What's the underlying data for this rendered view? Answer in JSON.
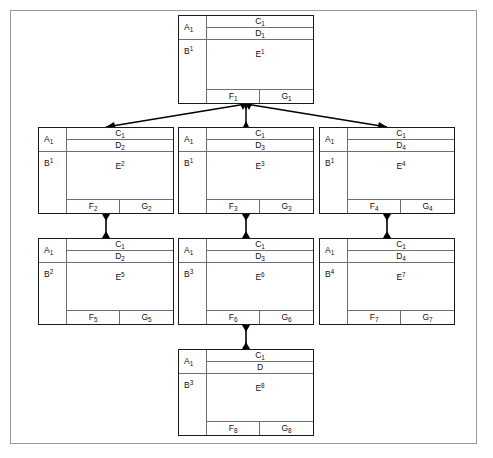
{
  "diagram": {
    "frame": {
      "stroke": "#9a9a9a"
    },
    "node_border_color": "#1a1a1a",
    "divider_color": "#6e6e6e",
    "connector_color": "#000000",
    "nodes": [
      {
        "id": "n1",
        "role": "root",
        "a": "A",
        "a_sub": "1",
        "b": "B",
        "b_sub": "1",
        "c": "C",
        "c_sub": "1",
        "d": "D",
        "d_sub": "1",
        "e": "E",
        "e_sub": "1",
        "f": "F",
        "f_sub": "1",
        "g": "G",
        "g_sub": "1"
      },
      {
        "id": "n2",
        "role": "row2-left",
        "a": "A",
        "a_sub": "1",
        "b": "B",
        "b_sub": "1",
        "c": "C",
        "c_sub": "1",
        "d": "D",
        "d_sub": "2",
        "e": "E",
        "e_sub": "2",
        "f": "F",
        "f_sub": "2",
        "g": "G",
        "g_sub": "2"
      },
      {
        "id": "n3",
        "role": "row2-middle",
        "a": "A",
        "a_sub": "1",
        "b": "B",
        "b_sub": "1",
        "c": "C",
        "c_sub": "1",
        "d": "D",
        "d_sub": "3",
        "e": "E",
        "e_sub": "3",
        "f": "F",
        "f_sub": "3",
        "g": "G",
        "g_sub": "3"
      },
      {
        "id": "n4",
        "role": "row2-right",
        "a": "A",
        "a_sub": "1",
        "b": "B",
        "b_sub": "1",
        "c": "C",
        "c_sub": "1",
        "d": "D",
        "d_sub": "4",
        "e": "E",
        "e_sub": "4",
        "f": "F",
        "f_sub": "4",
        "g": "G",
        "g_sub": "4"
      },
      {
        "id": "n5",
        "role": "row3-left",
        "a": "A",
        "a_sub": "1",
        "b": "B",
        "b_sub": "2",
        "c": "C",
        "c_sub": "1",
        "d": "D",
        "d_sub": "2",
        "e": "E",
        "e_sub": "5",
        "f": "F",
        "f_sub": "5",
        "g": "G",
        "g_sub": "5"
      },
      {
        "id": "n6",
        "role": "row3-middle",
        "a": "A",
        "a_sub": "1",
        "b": "B",
        "b_sub": "3",
        "c": "C",
        "c_sub": "1",
        "d": "D",
        "d_sub": "3",
        "e": "E",
        "e_sub": "6",
        "f": "F",
        "f_sub": "6",
        "g": "G",
        "g_sub": "6"
      },
      {
        "id": "n7",
        "role": "row3-right",
        "a": "A",
        "a_sub": "1",
        "b": "B",
        "b_sub": "4",
        "c": "C",
        "c_sub": "1",
        "d": "D",
        "d_sub": "4",
        "e": "E",
        "e_sub": "7",
        "f": "F",
        "f_sub": "7",
        "g": "G",
        "g_sub": "7"
      },
      {
        "id": "n8",
        "role": "row4-bottom",
        "a": "A",
        "a_sub": "1",
        "b": "B",
        "b_sub": "3",
        "c": "C",
        "c_sub": "1",
        "d": "D",
        "d_sub": "",
        "e": "E",
        "e_sub": "8",
        "f": "F",
        "f_sub": "8",
        "g": "G",
        "g_sub": "8"
      }
    ],
    "edges": [
      {
        "from": "n1",
        "to": "n2",
        "style": "diagonal-double-arrow"
      },
      {
        "from": "n1",
        "to": "n3",
        "style": "vertical-double-arrow"
      },
      {
        "from": "n1",
        "to": "n4",
        "style": "diagonal-double-arrow"
      },
      {
        "from": "n2",
        "to": "n5",
        "style": "vertical-double-arrow"
      },
      {
        "from": "n3",
        "to": "n6",
        "style": "vertical-double-arrow"
      },
      {
        "from": "n4",
        "to": "n7",
        "style": "vertical-double-arrow"
      },
      {
        "from": "n6",
        "to": "n8",
        "style": "vertical-double-arrow"
      }
    ]
  }
}
